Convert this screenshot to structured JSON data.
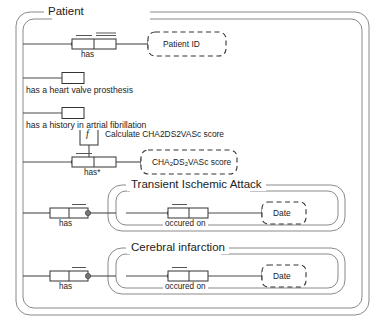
{
  "diagram": {
    "type": "orm-fact-diagram",
    "root_entity": {
      "name": "Patient",
      "title": "Patient"
    },
    "facts": [
      {
        "id": "patient-has-patient-id",
        "role_label": "has",
        "object_label": "Patient ID",
        "object_style": "dashed-value",
        "uniqueness": "double-bar",
        "mandatory": true
      },
      {
        "id": "patient-heart-valve-prosthesis",
        "role_label": "has a heart valve prosthesis",
        "unary": true,
        "uniqueness": "none",
        "mandatory": false
      },
      {
        "id": "patient-atrial-fibrillation-history",
        "role_label": "has a history in artrial fibrillation",
        "unary": true,
        "uniqueness": "none",
        "mandatory": false
      },
      {
        "id": "patient-has-chads-score",
        "role_label": "has*",
        "object_label": "CHA2DS2VASc score",
        "object_label_parts": [
          "CHA",
          "2",
          "DS",
          "2",
          "VASc score"
        ],
        "object_style": "dashed-value",
        "derivation_marker": "f",
        "derivation_label": "Calculate CHA2DS2VASc score",
        "mandatory": true
      }
    ],
    "nested_entities": [
      {
        "id": "transient-ischemic-attack",
        "title": "Transient Ischemic Attack",
        "outer_role_label": "has",
        "inner_role_label": "occured on",
        "inner_object_label": "Date",
        "inner_object_style": "dashed-value",
        "mandatory": true
      },
      {
        "id": "cerebral-infarction",
        "title": "Cerebral infarction",
        "outer_role_label": "has",
        "inner_role_label": "occured on",
        "inner_object_label": "Date",
        "inner_object_style": "dashed-value",
        "mandatory": true
      }
    ],
    "derivation": {
      "symbol": "f",
      "label": "Calculate CHA2DS2VASc score"
    },
    "colors": {
      "line": "#4a4a4a",
      "text": "#222222",
      "background": "#ffffff"
    }
  }
}
